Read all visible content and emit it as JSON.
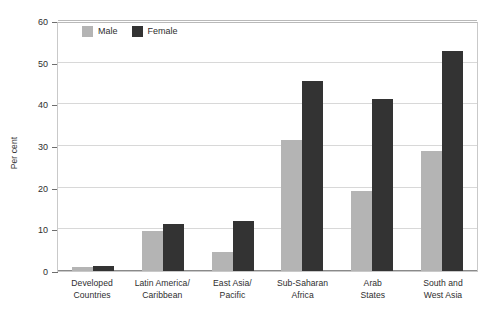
{
  "chart_data": {
    "type": "bar",
    "title": "",
    "xlabel": "",
    "ylabel": "Per cent",
    "ylim": [
      0,
      60
    ],
    "yticks": [
      0,
      10,
      20,
      30,
      40,
      50,
      60
    ],
    "ytick_labels": [
      "0",
      "10",
      "20",
      "30",
      "40",
      "50",
      "60"
    ],
    "grid": true,
    "legend_position": "top-left-inside",
    "categories": [
      "Developed Countries",
      "Latin America/ Caribbean",
      "East Asia/ Pacific",
      "Sub-Saharan Africa",
      "Arab States",
      "South and West Asia"
    ],
    "category_lines": [
      [
        "Developed",
        "Countries"
      ],
      [
        "Latin America/",
        "Caribbean"
      ],
      [
        "East Asia/",
        "Pacific"
      ],
      [
        "Sub-Saharan",
        "Africa"
      ],
      [
        "Arab",
        "States"
      ],
      [
        "South and",
        "West Asia"
      ]
    ],
    "series": [
      {
        "name": "Male",
        "color": "#b4b4b4",
        "values": [
          0.9,
          9.7,
          4.6,
          31.5,
          19.2,
          28.8
        ]
      },
      {
        "name": "Female",
        "color": "#333333",
        "values": [
          1.3,
          11.2,
          12.0,
          45.7,
          41.2,
          52.8
        ]
      }
    ]
  },
  "legend": {
    "items": [
      {
        "label": "Male",
        "color": "#b4b4b4"
      },
      {
        "label": "Female",
        "color": "#333333"
      }
    ]
  },
  "axis": {
    "y_title": "Per cent"
  },
  "colors": {
    "male": "#b4b4b4",
    "female": "#333333",
    "gridline": "#d8d8d8",
    "frame": "#c9c9c9",
    "axis": "#6e6e6e",
    "text": "#2e2e2e"
  }
}
